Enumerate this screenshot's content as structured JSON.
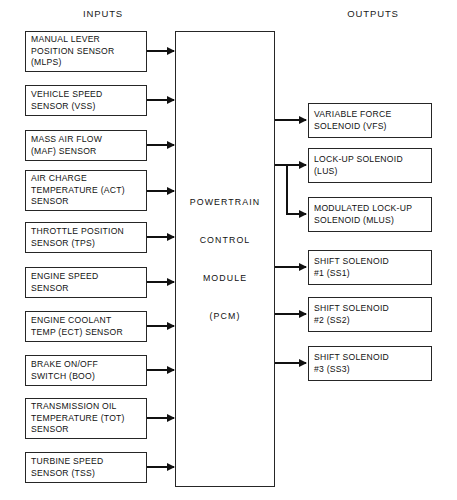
{
  "diagram": {
    "headings": {
      "inputs": "INPUTS",
      "outputs": "OUTPUTS"
    },
    "colors": {
      "background": "#ffffff",
      "stroke": "#262626",
      "text": "#111111",
      "connector": "#111111"
    }
  },
  "pcm": {
    "name": "Powertrain Control Module",
    "lines": [
      "POWERTRAIN",
      "CONTROL",
      "MODULE",
      "(PCM)"
    ]
  },
  "inputs": [
    {
      "id": "mlps",
      "lines": [
        "MANUAL LEVER",
        "POSITION SENSOR",
        "(MLPS)"
      ]
    },
    {
      "id": "vss",
      "lines": [
        "VEHICLE SPEED",
        "SENSOR (VSS)"
      ]
    },
    {
      "id": "maf",
      "lines": [
        "MASS AIR FLOW",
        "(MAF) SENSOR"
      ]
    },
    {
      "id": "act",
      "lines": [
        "AIR CHARGE",
        "TEMPERATURE (ACT)",
        "SENSOR"
      ]
    },
    {
      "id": "tps",
      "lines": [
        "THROTTLE POSITION",
        "SENSOR (TPS)"
      ]
    },
    {
      "id": "ess",
      "lines": [
        "ENGINE SPEED",
        "SENSOR"
      ]
    },
    {
      "id": "ect",
      "lines": [
        "ENGINE COOLANT",
        "TEMP (ECT) SENSOR"
      ]
    },
    {
      "id": "boo",
      "lines": [
        "BRAKE ON/OFF",
        "SWITCH (BOO)"
      ]
    },
    {
      "id": "tot",
      "lines": [
        "TRANSMISSION OIL",
        "TEMPERATURE (TOT)",
        "SENSOR"
      ]
    },
    {
      "id": "tss",
      "lines": [
        "TURBINE SPEED",
        "SENSOR (TSS)"
      ]
    }
  ],
  "outputs": [
    {
      "id": "vfs",
      "lines": [
        "VARIABLE FORCE",
        "SOLENOID (VFS)"
      ]
    },
    {
      "id": "lus",
      "lines": [
        "LOCK-UP SOLENOID",
        "(LUS)"
      ]
    },
    {
      "id": "mlus",
      "lines": [
        "MODULATED LOCK-UP",
        "SOLENOID (MLUS)"
      ]
    },
    {
      "id": "ss1",
      "lines": [
        "SHIFT SOLENOID",
        "#1 (SS1)"
      ]
    },
    {
      "id": "ss2",
      "lines": [
        "SHIFT SOLENOID",
        "#2 (SS2)"
      ]
    },
    {
      "id": "ss3",
      "lines": [
        "SHIFT SOLENOID",
        "#3 (SS3)"
      ]
    }
  ]
}
